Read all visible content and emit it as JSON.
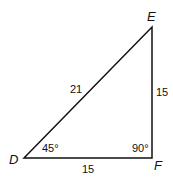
{
  "diagram": {
    "type": "right-triangle",
    "vertices": {
      "D": {
        "label": "D",
        "x": 24,
        "y": 158
      },
      "E": {
        "label": "E",
        "x": 152,
        "y": 27
      },
      "F": {
        "label": "F",
        "x": 152,
        "y": 158
      }
    },
    "sides": {
      "DE": {
        "label": "21"
      },
      "EF": {
        "label": "15"
      },
      "DF": {
        "label": "15"
      }
    },
    "angles": {
      "D": {
        "label": "45°"
      },
      "F": {
        "label": "90°"
      }
    },
    "colors": {
      "stroke": "#111111",
      "background": "#ffffff"
    }
  }
}
